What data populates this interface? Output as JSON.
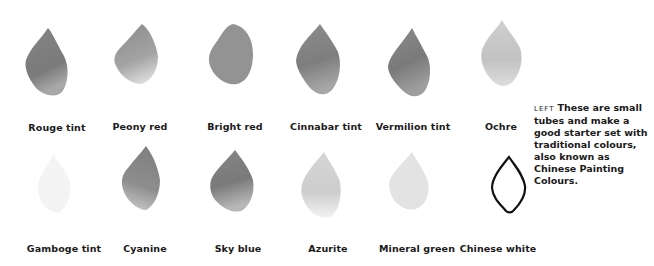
{
  "caption": {
    "tag": "LEFT",
    "text": "These are small tubes and make a good starter set with traditional colours, also known as Chinese Painting Colours."
  },
  "swatches": [
    {
      "label": "Rouge tint",
      "tone": "#7f7f7f",
      "row": 1
    },
    {
      "label": "Peony red",
      "tone": "#9a9a9a",
      "row": 1
    },
    {
      "label": "Bright red",
      "tone": "#909090",
      "row": 1
    },
    {
      "label": "Cinnabar tint",
      "tone": "#858585",
      "row": 1
    },
    {
      "label": "Vermilion tint",
      "tone": "#808080",
      "row": 1
    },
    {
      "label": "Ochre",
      "tone": "#c4c4c4",
      "row": 1
    },
    {
      "label": "Gamboge tint",
      "tone": "#f2f2f2",
      "row": 2
    },
    {
      "label": "Cyanine",
      "tone": "#888888",
      "row": 2
    },
    {
      "label": "Sky blue",
      "tone": "#7c7c7c",
      "row": 2
    },
    {
      "label": "Azurite",
      "tone": "#d2d2d2",
      "row": 2
    },
    {
      "label": "Mineral green",
      "tone": "#e2e2e2",
      "row": 2
    },
    {
      "label": "Chinese white",
      "tone": "outline",
      "row": 2
    }
  ]
}
